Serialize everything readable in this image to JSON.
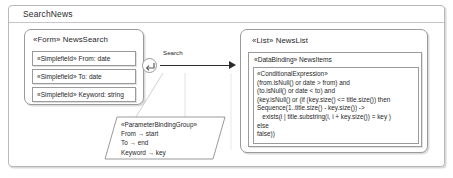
{
  "package": {
    "title": "SearchNews"
  },
  "form": {
    "stereotype": "«Form»",
    "name": "NewsSearch",
    "header": "«Form» NewsSearch",
    "fields": [
      {
        "stereotype": "«Simplefield»",
        "name": "From",
        "type": "date",
        "label": "«Simplefield» From: date"
      },
      {
        "stereotype": "«Simplefield»",
        "name": "To",
        "type": "date",
        "label": "«Simplefield» To: date"
      },
      {
        "stereotype": "«Simplefield»",
        "name": "Keyword",
        "type": "string",
        "label": "«Simplefield» Keyword: string"
      }
    ]
  },
  "association": {
    "label": "Search",
    "badge_icon": "return-arrow-icon"
  },
  "list": {
    "stereotype": "«List»",
    "name": "NewsList",
    "header": "«List» NewsList",
    "databinding": {
      "stereotype": "«DataBinding»",
      "name": "NewsItems",
      "label": "«DataBinding» NewsItems"
    },
    "condition": {
      "stereotype": "«ConditionalExpression»",
      "lines": [
        "«ConditionalExpression»",
        "(from.isNull() or date > from) and",
        "(to.isNull() or date < to) and",
        "(key.isNull() or (if (key.size() <= title.size()) then",
        "Sequence(1..title.size() - key.size()) ->",
        "   exists(i | title.substring(i, i + key.size()) = key )",
        "else",
        "false))"
      ],
      "text": "«ConditionalExpression»\n(from.isNull() or date > from) and\n(to.isNull() or date < to) and\n(key.isNull() or (if (key.size() <= title.size()) then\nSequence(1..title.size() - key.size()) ->\n   exists(i | title.substring(i, i + key.size()) = key )\nelse\nfalse))"
    }
  },
  "binding_note": {
    "stereotype": "«ParameterBindingGroup»",
    "bindings": [
      {
        "from": "From",
        "to": "start",
        "label": "From → start"
      },
      {
        "from": "To",
        "to": "end",
        "label": "To → end"
      },
      {
        "from": "Keyword",
        "to": "key",
        "label": "Keyword → key"
      }
    ],
    "text": "«ParameterBindingGroup»\nFrom → start\nTo → end\nKeyword → key"
  },
  "colors": {
    "background": "#ffffff",
    "border": "#9a9a9a",
    "frame_border": "#b9b9b9",
    "text": "#1f1f1f",
    "arrow": "#2b2b2b",
    "note_connector": "#d2d2d2"
  }
}
